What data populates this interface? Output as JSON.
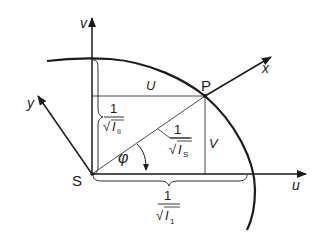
{
  "diagram": {
    "labels": {
      "axis_v": "v",
      "axis_u": "u",
      "axis_x": "x",
      "axis_y": "y",
      "origin": "S",
      "point": "P",
      "segment_u": "U",
      "segment_v": "V",
      "angle": "φ",
      "frac_num": "1",
      "radical": "√",
      "moment_II": "I",
      "moment_II_sub": "II",
      "moment_S": "I",
      "moment_S_sub": "S",
      "moment_I": "I",
      "moment_I_sub": "1"
    },
    "colors": {
      "ink": "#1a1a1a",
      "background": "#ffffff"
    }
  }
}
